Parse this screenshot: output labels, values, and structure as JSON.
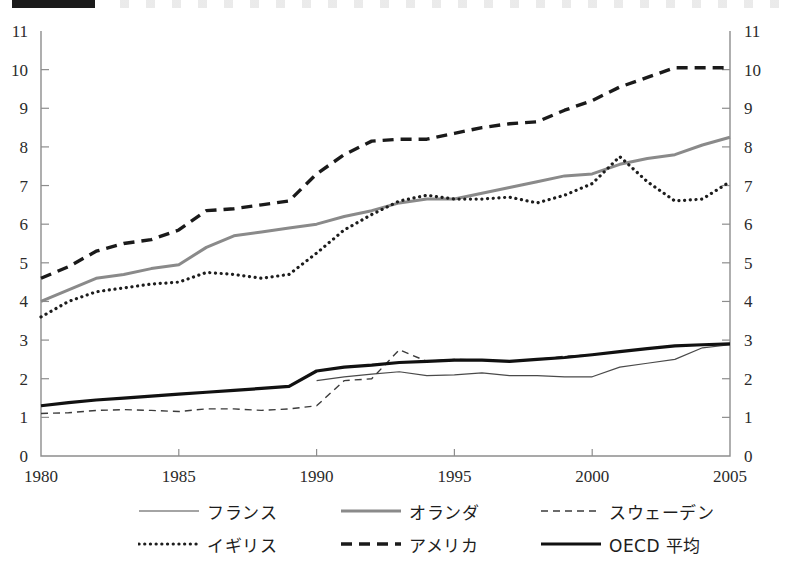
{
  "page": {
    "redaction_bar": "redacted-title",
    "background_color": "#ffffff"
  },
  "chart_data": {
    "type": "line",
    "title": "",
    "subtitle": "",
    "xlabel": "",
    "ylabel": "",
    "xlim": [
      1980,
      2005
    ],
    "ylim": [
      0,
      11
    ],
    "grid": false,
    "legend_position": "bottom",
    "x_ticks": [
      1980,
      1985,
      1990,
      1995,
      2000,
      2005
    ],
    "x_tick_labels": [
      "1980",
      "1985",
      "1990",
      "1995",
      "2000",
      "2005"
    ],
    "y_ticks": [
      0,
      1,
      2,
      3,
      4,
      5,
      6,
      7,
      8,
      9,
      10,
      11
    ],
    "y_tick_labels": [
      "0",
      "1",
      "2",
      "3",
      "4",
      "5",
      "6",
      "7",
      "8",
      "9",
      "10",
      "11"
    ],
    "y_axis_right_mirrored": true,
    "x": [
      1980,
      1981,
      1982,
      1983,
      1984,
      1985,
      1986,
      1987,
      1988,
      1989,
      1990,
      1991,
      1992,
      1993,
      1994,
      1995,
      1996,
      1997,
      1998,
      1999,
      2000,
      2001,
      2002,
      2003,
      2004,
      2005
    ],
    "series": [
      {
        "name": "フランス",
        "name_en": "France",
        "style": "solid-thin",
        "color": "#4a4a4a",
        "width": 1.2,
        "x": [
          1990,
          1991,
          1992,
          1993,
          1994,
          1995,
          1996,
          1997,
          1998,
          1999,
          2000,
          2001,
          2002,
          2003,
          2004,
          2005
        ],
        "values": [
          1.95,
          2.05,
          2.12,
          2.18,
          2.08,
          2.1,
          2.15,
          2.08,
          2.08,
          2.05,
          2.05,
          2.3,
          2.4,
          2.5,
          2.8,
          2.88
        ]
      },
      {
        "name": "オランダ",
        "name_en": "Netherlands",
        "style": "solid-thick-gray",
        "color": "#8a8a8a",
        "width": 3.0,
        "x": [
          1980,
          1981,
          1982,
          1983,
          1984,
          1985,
          1986,
          1987,
          1988,
          1989,
          1990,
          1991,
          1992,
          1993,
          1994,
          1995,
          1996,
          1997,
          1998,
          1999,
          2000,
          2001,
          2002,
          2003,
          2004,
          2005
        ],
        "values": [
          4.0,
          4.3,
          4.6,
          4.7,
          4.85,
          4.95,
          5.4,
          5.7,
          5.8,
          5.9,
          6.0,
          6.2,
          6.35,
          6.55,
          6.65,
          6.65,
          6.8,
          6.95,
          7.1,
          7.25,
          7.3,
          7.55,
          7.7,
          7.8,
          8.05,
          8.25
        ]
      },
      {
        "name": "スウェーデン",
        "name_en": "Sweden",
        "style": "dashed-thin",
        "color": "#3b3b3b",
        "width": 1.3,
        "x": [
          1980,
          1981,
          1982,
          1983,
          1984,
          1985,
          1986,
          1987,
          1988,
          1989,
          1990,
          1991,
          1992,
          1993,
          1994,
          1995,
          1996,
          1997,
          1998,
          1999,
          2000,
          2001,
          2002,
          2003,
          2004,
          2005
        ],
        "values": [
          1.1,
          1.12,
          1.18,
          1.2,
          1.18,
          1.15,
          1.22,
          1.22,
          1.18,
          1.22,
          1.3,
          1.95,
          2.0,
          2.75,
          2.45,
          2.5,
          2.48,
          2.45,
          2.5,
          2.58,
          2.62,
          2.7,
          2.78,
          2.85,
          2.88,
          2.9
        ]
      },
      {
        "name": "イギリス",
        "name_en": "United Kingdom",
        "style": "dotted",
        "color": "#1d1d1d",
        "width": 3.0,
        "x": [
          1980,
          1981,
          1982,
          1983,
          1984,
          1985,
          1986,
          1987,
          1988,
          1989,
          1990,
          1991,
          1992,
          1993,
          1994,
          1995,
          1996,
          1997,
          1998,
          1999,
          2000,
          2001,
          2002,
          2003,
          2004,
          2005
        ],
        "values": [
          3.6,
          4.0,
          4.25,
          4.35,
          4.45,
          4.5,
          4.75,
          4.7,
          4.6,
          4.7,
          5.25,
          5.85,
          6.25,
          6.6,
          6.75,
          6.65,
          6.65,
          6.7,
          6.55,
          6.75,
          7.05,
          7.75,
          7.1,
          6.6,
          6.65,
          7.1
        ]
      },
      {
        "name": "アメリカ",
        "name_en": "United States",
        "style": "dashed-thick",
        "color": "#1a1a1a",
        "width": 3.4,
        "x": [
          1980,
          1981,
          1982,
          1983,
          1984,
          1985,
          1986,
          1987,
          1988,
          1989,
          1990,
          1991,
          1992,
          1993,
          1994,
          1995,
          1996,
          1997,
          1998,
          1999,
          2000,
          2001,
          2002,
          2003,
          2004,
          2005
        ],
        "values": [
          4.6,
          4.9,
          5.3,
          5.5,
          5.6,
          5.85,
          6.35,
          6.4,
          6.5,
          6.6,
          7.3,
          7.8,
          8.15,
          8.2,
          8.2,
          8.35,
          8.5,
          8.6,
          8.65,
          8.95,
          9.2,
          9.55,
          9.8,
          10.05,
          10.05,
          10.05
        ]
      },
      {
        "name": "OECD 平均",
        "name_en": "OECD average",
        "style": "solid-thick-black",
        "color": "#111111",
        "width": 3.2,
        "x": [
          1980,
          1981,
          1982,
          1983,
          1984,
          1985,
          1986,
          1987,
          1988,
          1989,
          1990,
          1991,
          1992,
          1993,
          1994,
          1995,
          1996,
          1997,
          1998,
          1999,
          2000,
          2001,
          2002,
          2003,
          2004,
          2005
        ],
        "values": [
          1.3,
          1.38,
          1.45,
          1.5,
          1.55,
          1.6,
          1.65,
          1.7,
          1.75,
          1.8,
          2.2,
          2.3,
          2.35,
          2.42,
          2.45,
          2.48,
          2.48,
          2.45,
          2.5,
          2.55,
          2.62,
          2.7,
          2.78,
          2.85,
          2.88,
          2.9
        ]
      }
    ],
    "legend": [
      {
        "label": "フランス",
        "style": "solid-thin",
        "color": "#4a4a4a"
      },
      {
        "label": "オランダ",
        "style": "solid-thick-gray",
        "color": "#8a8a8a"
      },
      {
        "label": "スウェーデン",
        "style": "dashed-thin",
        "color": "#3b3b3b"
      },
      {
        "label": "イギリス",
        "style": "dotted",
        "color": "#1d1d1d"
      },
      {
        "label": "アメリカ",
        "style": "dashed-thick",
        "color": "#1a1a1a"
      },
      {
        "label": "OECD 平均",
        "style": "solid-thick-black",
        "color": "#111111"
      }
    ]
  }
}
